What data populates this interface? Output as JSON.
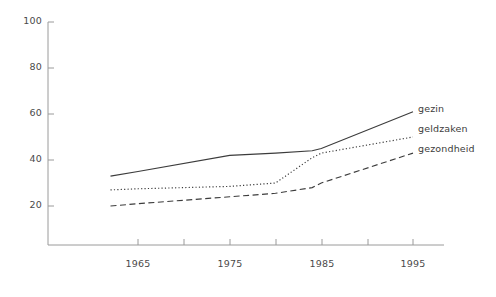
{
  "chart_data": {
    "type": "line",
    "title": "",
    "xlabel": "",
    "ylabel": "",
    "xlim": [
      1962,
      1996
    ],
    "ylim": [
      0,
      100
    ],
    "grid": false,
    "legend_position": "right-inline",
    "x_ticks_labeled": [
      1965,
      1975,
      1985,
      1995
    ],
    "x_ticks_minor": [
      1970,
      1980,
      1990
    ],
    "y_ticks": [
      20,
      40,
      60,
      80,
      100
    ],
    "x_tick_labels": [
      "1965",
      "1975",
      "1985",
      "1995"
    ],
    "y_tick_labels": [
      "20",
      "40",
      "60",
      "80",
      "100"
    ],
    "series": [
      {
        "name": "gezin",
        "style": "solid",
        "color": "#3c3c3c",
        "x": [
          1962,
          1965,
          1975,
          1980,
          1984,
          1985,
          1995
        ],
        "values": [
          33,
          35,
          42,
          43,
          44,
          45,
          61
        ]
      },
      {
        "name": "geldzaken",
        "style": "dotted",
        "color": "#3c3c3c",
        "x": [
          1962,
          1965,
          1975,
          1980,
          1984,
          1985,
          1995
        ],
        "values": [
          27,
          27.5,
          28.5,
          30,
          41,
          43,
          50
        ]
      },
      {
        "name": "gezondheid",
        "style": "dashed",
        "color": "#3c3c3c",
        "x": [
          1962,
          1965,
          1975,
          1980,
          1984,
          1985,
          1995
        ],
        "values": [
          20,
          21,
          24,
          25.5,
          28,
          30,
          43
        ]
      }
    ]
  },
  "legend": {
    "items": [
      {
        "label": "gezin"
      },
      {
        "label": "geldzaken"
      },
      {
        "label": "gezondheid"
      }
    ]
  },
  "axes": {
    "y_labels": [
      "100",
      "80",
      "60",
      "40",
      "20"
    ],
    "x_labels": [
      "1965",
      "1975",
      "1985",
      "1995"
    ]
  },
  "colors": {
    "axis": "#9a9a9a",
    "line": "#3c3c3c",
    "text": "#3c3c3c",
    "background": "#ffffff"
  }
}
